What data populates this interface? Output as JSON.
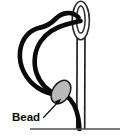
{
  "figure": {
    "background_color": "#ffffff",
    "width": 124,
    "height": 136
  },
  "labels": [
    {
      "id": "bead-label",
      "text": "Bead",
      "x": 12,
      "y": 119,
      "font_size": 11.5,
      "color": "#0a0a0a",
      "bold": true
    }
  ],
  "annotations": {
    "leader_arrow": {
      "name": "bead-leader-arrow",
      "from_x": 43,
      "from_y": 117,
      "to_x": 60,
      "to_y": 100,
      "color": "#111111",
      "stroke_width": 1.1
    }
  },
  "parts": {
    "needle": {
      "name": "sewing-needle",
      "shaft_color": "#2b2b2b",
      "shaft_fill": "#fdfdfd",
      "shaft_left_x": 77,
      "shaft_right_x": 85,
      "shaft_top_y": 34,
      "shaft_bottom_y": 129,
      "eye_outer_cx": 80.5,
      "eye_outer_cy": 20,
      "eye_outer_rx": 8.5,
      "eye_outer_ry": 19,
      "eye_inner_cx": 80.5,
      "eye_inner_cy": 19,
      "eye_inner_rx": 4.2,
      "eye_inner_ry": 13.5
    },
    "thread": {
      "name": "thread",
      "color": "#0b0b0b",
      "stroke_width": 4.6
    },
    "bead": {
      "name": "bead",
      "fill_color": "#b9b9b9",
      "stroke_color": "#1a1a1a",
      "center_x": 61,
      "center_y": 92,
      "radius_x": 12.5,
      "radius_y": 8.5,
      "rotation_deg": -58
    },
    "ground_line": {
      "name": "fabric-surface-line",
      "color": "#4d4d4d",
      "x1": 30,
      "x2": 120,
      "y": 129,
      "stroke_width": 1.6
    }
  }
}
